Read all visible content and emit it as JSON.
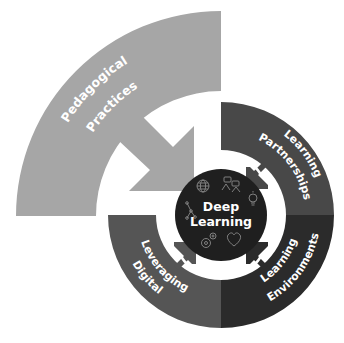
{
  "diagram": {
    "type": "framework-wheel",
    "center": {
      "line1": "Deep",
      "line2": "Learning",
      "color": "#1f1f1f",
      "icons": [
        "globe-icon",
        "people-network-icon",
        "lightbulb-icon",
        "gears-icon",
        "heart-hands-icon",
        "connected-nodes-icon"
      ]
    },
    "outer_element": {
      "line1": "Pedagogical",
      "line2": "Practices",
      "color": "#a6a6a6"
    },
    "ring_segments": [
      {
        "id": "learning-partnerships",
        "line1": "Learning",
        "line2": "Partnerships",
        "position": "top-right",
        "color": "#484848"
      },
      {
        "id": "learning-environments",
        "line1": "Learning",
        "line2": "Environments",
        "position": "bottom-right",
        "color": "#2b2b2b"
      },
      {
        "id": "leveraging-digital",
        "line1": "Leveraging",
        "line2": "Digital",
        "position": "bottom-left",
        "color": "#555555"
      }
    ],
    "arrows": [
      {
        "from": "Pedagogical Practices",
        "to": "Deep Learning"
      },
      {
        "from": "Learning Partnerships",
        "to": "Deep Learning"
      },
      {
        "from": "Learning Environments",
        "to": "Deep Learning"
      },
      {
        "from": "Leveraging Digital",
        "to": "Deep Learning"
      }
    ]
  }
}
